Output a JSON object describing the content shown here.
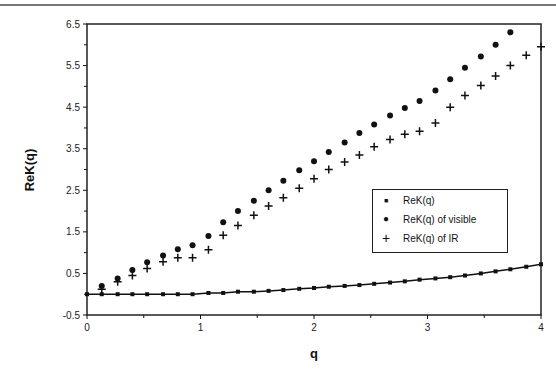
{
  "chart_data": {
    "type": "scatter",
    "title": "",
    "xlabel": "q",
    "ylabel": "ReK(q)",
    "xlim": [
      0,
      4
    ],
    "ylim": [
      -0.5,
      6.5
    ],
    "x_ticks": [
      "0",
      "1",
      "2",
      "3",
      "4"
    ],
    "y_ticks": [
      "6.5",
      "5.5",
      "4.5",
      "3.5",
      "2.5",
      "1.5",
      "0.5",
      "-0.5"
    ],
    "grid": false,
    "legend_position": "inside right-middle",
    "series": [
      {
        "name": "ReK(q)",
        "marker": "small-square-line",
        "x": [
          0,
          0.13,
          0.27,
          0.4,
          0.53,
          0.67,
          0.8,
          0.93,
          1.07,
          1.2,
          1.33,
          1.47,
          1.6,
          1.73,
          1.87,
          2.0,
          2.13,
          2.27,
          2.4,
          2.53,
          2.67,
          2.8,
          2.93,
          3.07,
          3.2,
          3.33,
          3.47,
          3.6,
          3.73,
          3.87,
          4.0
        ],
        "values": [
          0,
          0,
          0,
          0,
          0,
          0,
          0,
          0,
          0.03,
          0.03,
          0.06,
          0.06,
          0.08,
          0.1,
          0.13,
          0.15,
          0.18,
          0.2,
          0.22,
          0.25,
          0.28,
          0.31,
          0.35,
          0.38,
          0.41,
          0.45,
          0.5,
          0.55,
          0.6,
          0.66,
          0.72
        ]
      },
      {
        "name": "ReK(q) of visible",
        "marker": "filled-circle",
        "x": [
          0.13,
          0.27,
          0.4,
          0.53,
          0.67,
          0.8,
          0.93,
          1.07,
          1.2,
          1.33,
          1.47,
          1.6,
          1.73,
          1.87,
          2.0,
          2.13,
          2.27,
          2.4,
          2.53,
          2.67,
          2.8,
          2.93,
          3.07,
          3.2,
          3.33,
          3.47,
          3.6,
          3.73
        ],
        "values": [
          0.2,
          0.38,
          0.58,
          0.77,
          0.93,
          1.08,
          1.18,
          1.4,
          1.73,
          2.0,
          2.25,
          2.5,
          2.73,
          2.98,
          3.2,
          3.42,
          3.65,
          3.88,
          4.08,
          4.3,
          4.48,
          4.65,
          4.9,
          5.17,
          5.45,
          5.72,
          6.0,
          6.3
        ]
      },
      {
        "name": "ReK(q) of IR",
        "marker": "plus",
        "x": [
          0.13,
          0.27,
          0.4,
          0.53,
          0.67,
          0.8,
          0.93,
          1.07,
          1.2,
          1.33,
          1.47,
          1.6,
          1.73,
          1.87,
          2.0,
          2.13,
          2.27,
          2.4,
          2.53,
          2.67,
          2.8,
          2.93,
          3.07,
          3.2,
          3.33,
          3.47,
          3.6,
          3.73,
          3.87,
          4.0
        ],
        "values": [
          0.12,
          0.3,
          0.45,
          0.62,
          0.78,
          0.88,
          0.88,
          1.07,
          1.42,
          1.65,
          1.9,
          2.12,
          2.32,
          2.55,
          2.78,
          3.0,
          3.18,
          3.35,
          3.55,
          3.72,
          3.85,
          3.92,
          4.12,
          4.5,
          4.78,
          5.02,
          5.25,
          5.5,
          5.75,
          5.95
        ]
      }
    ]
  },
  "legend": {
    "items": [
      {
        "symbol": "■",
        "label": "ReK(q)"
      },
      {
        "symbol": "●",
        "label": "ReK(q) of visible"
      },
      {
        "symbol": "+",
        "label": "ReK(q) of IR"
      }
    ]
  },
  "colors": {
    "ink": "#111111",
    "frame": "#222222",
    "background": "#ffffff"
  }
}
